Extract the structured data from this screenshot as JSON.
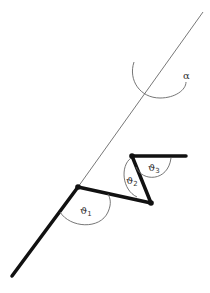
{
  "diagram": {
    "type": "kinematic-chain",
    "colors": {
      "link": "#111111",
      "thin_line": "#555555",
      "arc": "#666666",
      "text": "#333333"
    },
    "labels": {
      "alpha": "α",
      "theta1": "ϑ",
      "theta1_sub": "1",
      "theta2": "ϑ",
      "theta2_sub": "2",
      "theta3": "ϑ",
      "theta3_sub": "3"
    },
    "points": {
      "base": [
        12,
        276
      ],
      "joint1": [
        78,
        187
      ],
      "joint2": [
        151,
        203
      ],
      "joint3": [
        132,
        156
      ],
      "end": [
        186,
        156
      ],
      "reference_line_top": [
        203,
        12
      ]
    }
  }
}
